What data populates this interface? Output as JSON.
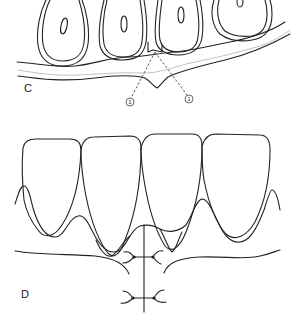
{
  "panels": [
    {
      "id": "C",
      "label": "C",
      "description": "Cross-section of four tooth roots in alveolar bone with gingiva; callouts marking interdental region",
      "callouts": [
        {
          "text": "1"
        },
        {
          "text": "1"
        }
      ]
    },
    {
      "id": "D",
      "label": "D",
      "description": "Labial view of four incisor crowns with gingival margins and interrupted sutures along midline incision"
    }
  ],
  "colors": {
    "line": "#222222",
    "background": "#ffffff",
    "gingiva_hatch": "#bbbbbb"
  }
}
